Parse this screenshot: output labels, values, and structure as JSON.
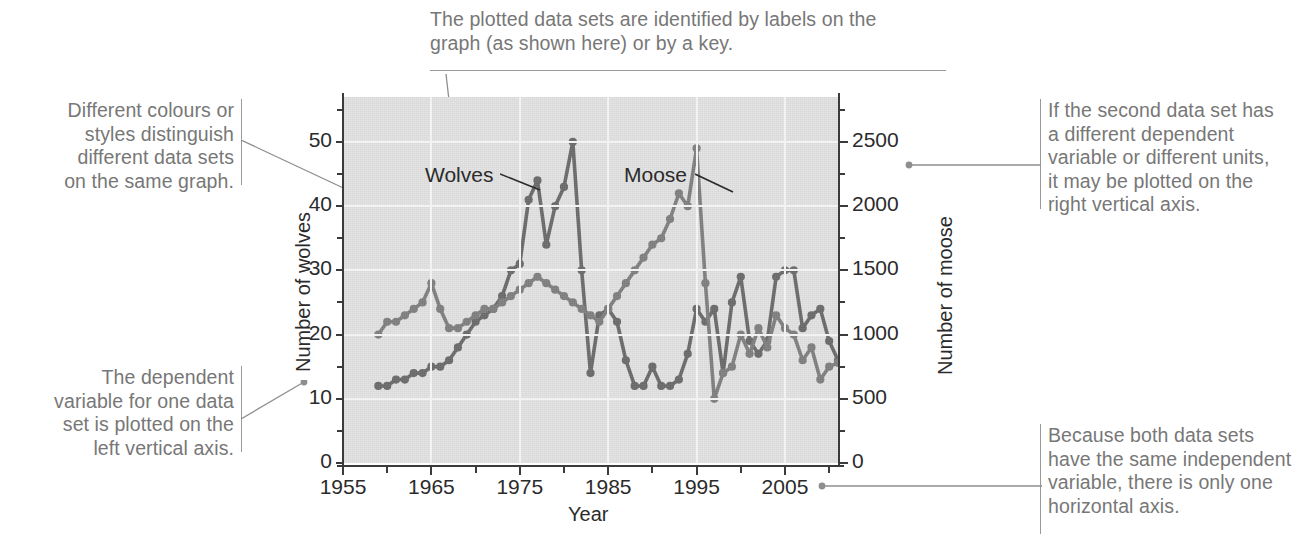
{
  "annotations": {
    "top": "The plotted data sets are identified by labels on the\ngraph (as shown here) or by a key.",
    "left_upper": "Different colours or\nstyles distinguish\ndifferent data sets\non the same graph.",
    "left_lower": "The dependent\nvariable for one data\nset is plotted on the\nleft vertical axis.",
    "right_upper": "If the second data set has\na different dependent\nvariable or different units,\nit may be plotted on the\nright vertical axis.",
    "right_lower": "Because both data sets\nhave the same independent\nvariable, there is only one\nhorizontal axis."
  },
  "colors": {
    "plot_background": "#e2e2e2",
    "gridline": "#f2f2f2",
    "axis": "#3b3b3b",
    "wolves": "#6b6b6b",
    "moose": "#808080",
    "callout_text": "#777777",
    "leader": "#8e8e8e"
  },
  "chart_data": {
    "type": "line",
    "title": "",
    "xlabel": "Year",
    "ylabel": "Number of wolves",
    "y2label": "Number of moose",
    "xlim": [
      1955,
      2011
    ],
    "ylim": [
      0,
      57
    ],
    "y2lim": [
      0,
      2850
    ],
    "xticks": [
      1955,
      1965,
      1975,
      1985,
      1995,
      2005
    ],
    "xtick_labels": [
      "1955",
      "1965",
      "1975",
      "1985",
      "1995",
      "2005"
    ],
    "xminor_step": 5,
    "yticks": [
      0,
      10,
      20,
      30,
      40,
      50
    ],
    "ytick_labels": [
      "0",
      "10",
      "20",
      "30",
      "40",
      "50"
    ],
    "yminor_step": 5,
    "y2ticks": [
      0,
      500,
      1000,
      1500,
      2000,
      2500
    ],
    "y2tick_labels": [
      "0",
      "500",
      "1000",
      "1500",
      "2000",
      "2500"
    ],
    "y2minor_step": 250,
    "grid": true,
    "grid_axis": "both",
    "legend": "in-plot-labels",
    "series": [
      {
        "name": "Wolves",
        "axis": "left",
        "color": "#6b6b6b",
        "marker": "circle",
        "label_x": 1970.2,
        "label_y": 45.0,
        "x": [
          1959,
          1960,
          1961,
          1962,
          1963,
          1964,
          1965,
          1966,
          1967,
          1968,
          1969,
          1970,
          1971,
          1972,
          1973,
          1974,
          1975,
          1976,
          1977,
          1978,
          1979,
          1980,
          1981,
          1982,
          1983,
          1984,
          1985,
          1986,
          1987,
          1988,
          1989,
          1990,
          1991,
          1992,
          1993,
          1994,
          1995,
          1996,
          1997,
          1998,
          1999,
          2000,
          2001,
          2002,
          2003,
          2004,
          2005,
          2006,
          2007,
          2008,
          2009,
          2010,
          2011
        ],
        "y": [
          12,
          12,
          13,
          13,
          14,
          14,
          15,
          15,
          16,
          18,
          20,
          22,
          23,
          24,
          26,
          30,
          31,
          41,
          44,
          34,
          40,
          43,
          50,
          30,
          14,
          23,
          24,
          22,
          16,
          12,
          12,
          15,
          12,
          12,
          13,
          17,
          24,
          22,
          24,
          14,
          25,
          29,
          19,
          17,
          19,
          29,
          30,
          30,
          21,
          23,
          24,
          19,
          16
        ]
      },
      {
        "name": "Moose",
        "axis": "right",
        "color": "#808080",
        "marker": "circle",
        "label_x": 1986.5,
        "label_y": 45.0,
        "x": [
          1959,
          1960,
          1961,
          1962,
          1963,
          1964,
          1965,
          1966,
          1967,
          1968,
          1969,
          1970,
          1971,
          1972,
          1973,
          1974,
          1975,
          1976,
          1977,
          1978,
          1979,
          1980,
          1981,
          1982,
          1983,
          1984,
          1985,
          1986,
          1987,
          1988,
          1989,
          1990,
          1991,
          1992,
          1993,
          1994,
          1995,
          1996,
          1997,
          1998,
          1999,
          2000,
          2001,
          2002,
          2003,
          2004,
          2005,
          2006,
          2007,
          2008,
          2009,
          2010,
          2011
        ],
        "y": [
          1000,
          1100,
          1100,
          1150,
          1200,
          1250,
          1400,
          1200,
          1050,
          1050,
          1100,
          1150,
          1200,
          1200,
          1250,
          1300,
          1350,
          1400,
          1450,
          1400,
          1350,
          1300,
          1250,
          1200,
          1150,
          1100,
          1200,
          1300,
          1400,
          1500,
          1600,
          1700,
          1750,
          1900,
          2100,
          2000,
          2450,
          1400,
          500,
          700,
          750,
          1000,
          850,
          1050,
          900,
          1150,
          1050,
          1000,
          800,
          900,
          650,
          750,
          780
        ]
      }
    ]
  },
  "series_labels": {
    "wolves": "Wolves",
    "moose": "Moose"
  }
}
